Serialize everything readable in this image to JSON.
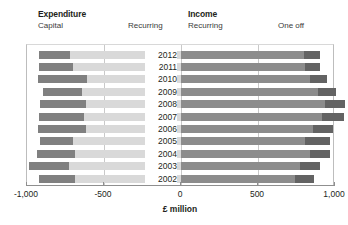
{
  "legend": {
    "groups": [
      {
        "title": "Expenditure",
        "items": [
          {
            "label": "Capital",
            "color": "#808080"
          },
          {
            "label": "Recurring",
            "color": "#d9d9d9"
          }
        ]
      },
      {
        "title": "Income",
        "items": [
          {
            "label": "Recurring",
            "color": "#8c8c8c"
          },
          {
            "label": "One off",
            "color": "#636363"
          }
        ]
      }
    ]
  },
  "axis": {
    "title": "£ million",
    "min": -1000,
    "max": 1000,
    "ticks": [
      {
        "value": -1000,
        "label": "-1,000"
      },
      {
        "value": -500,
        "label": "-500"
      },
      {
        "value": 0,
        "label": "0"
      },
      {
        "value": 500,
        "label": "500"
      },
      {
        "value": 1000,
        "label": "1,000"
      }
    ],
    "gridlines": [
      -500,
      0,
      500
    ]
  },
  "chart_data": {
    "type": "bar",
    "title": "",
    "subtitle": "",
    "xlabel": "£ million",
    "ylabel": "",
    "xlim": [
      -1000,
      1000
    ],
    "grid": true,
    "legend_position": "top",
    "orientation": "horizontal",
    "stacked": true,
    "diverging": true,
    "categories": [
      "2012",
      "2011",
      "2010",
      "2009",
      "2008",
      "2007",
      "2006",
      "2005",
      "2004",
      "2003",
      "2002"
    ],
    "series": [
      {
        "name": "Expenditure Capital",
        "color": "#808080",
        "side": "negative",
        "values": [
          -200,
          -225,
          -320,
          -255,
          -300,
          -290,
          -310,
          -215,
          -245,
          -265,
          -230
        ]
      },
      {
        "name": "Expenditure Recurring",
        "color": "#d9d9d9",
        "side": "negative",
        "values": [
          -720,
          -700,
          -610,
          -640,
          -615,
          -630,
          -620,
          -700,
          -690,
          -725,
          -690
        ]
      },
      {
        "name": "Income Recurring",
        "color": "#8c8c8c",
        "side": "positive",
        "values": [
          800,
          805,
          840,
          890,
          935,
          915,
          860,
          805,
          835,
          775,
          740
        ]
      },
      {
        "name": "Income One off",
        "color": "#636363",
        "side": "positive",
        "values": [
          105,
          100,
          110,
          115,
          130,
          145,
          130,
          165,
          130,
          130,
          125
        ]
      }
    ],
    "totals": {
      "expenditure": [
        -920,
        -925,
        -930,
        -895,
        -915,
        -920,
        -930,
        -915,
        -935,
        -990,
        -920
      ],
      "income": [
        905,
        905,
        950,
        1005,
        1065,
        1060,
        990,
        970,
        965,
        905,
        865
      ]
    }
  }
}
